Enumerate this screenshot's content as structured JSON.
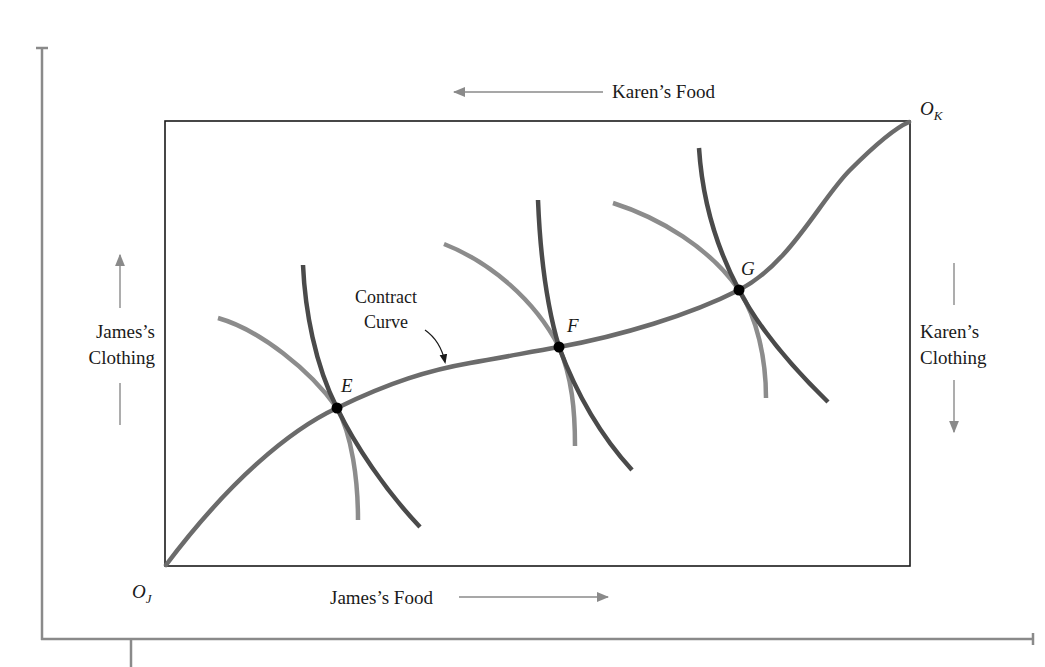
{
  "diagram": {
    "type": "edgeworth-box",
    "colors": {
      "frame": "#8a8a8a",
      "box": "#1a1a1a",
      "contract_curve": "#6b6b6b",
      "james_indifference": "#4a4a4a",
      "karen_indifference": "#8c8c8c",
      "point": "#000000",
      "arrow": "#8a8a8a"
    },
    "labels": {
      "karens_food": "Karen’s Food",
      "james_food": "James’s Food",
      "james_clothing_line1": "James’s",
      "james_clothing_line2": "Clothing",
      "karen_clothing_line1": "Karen’s",
      "karen_clothing_line2": "Clothing",
      "contract_line1": "Contract",
      "contract_line2": "Curve",
      "origin_james_main": "O",
      "origin_james_sub": "J",
      "origin_karen_main": "O",
      "origin_karen_sub": "K",
      "point_e": "E",
      "point_f": "F",
      "point_g": "G"
    },
    "points": [
      {
        "name": "E",
        "x": 337,
        "y": 408
      },
      {
        "name": "F",
        "x": 559,
        "y": 347
      },
      {
        "name": "G",
        "x": 739,
        "y": 290
      }
    ],
    "contract_curve_path": "M166,565 C230,480 290,430 337,408 C390,382 430,370 470,363 C500,358 530,352 559,347 C620,336 690,315 739,290 C790,264 820,200 850,170 C875,145 895,128 909,122",
    "james_curves": [
      "M303,265 C305,310 315,365 337,408 C355,445 385,490 420,527",
      "M538,200 C540,250 545,300 559,347 C575,390 600,435 632,470",
      "M699,148 C702,195 715,245 739,290 C760,330 795,370 828,402"
    ],
    "karen_curves": [
      "M218,318 C260,330 310,370 337,408 C352,435 358,480 358,520",
      "M444,244 C490,262 535,300 559,347 C572,378 575,410 575,446",
      "M613,203 C660,218 710,248 739,290 C757,318 766,358 766,398"
    ]
  }
}
